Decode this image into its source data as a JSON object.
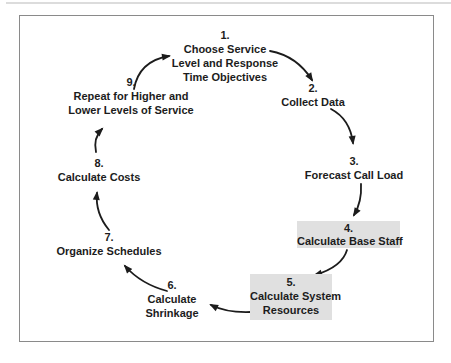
{
  "diagram": {
    "name": "call-center-planning-cycle",
    "steps": [
      {
        "number": "1.",
        "lines": [
          "Choose Service",
          "Level and Response",
          "Time Objectives"
        ],
        "highlighted": false
      },
      {
        "number": "2.",
        "lines": [
          "Collect Data"
        ],
        "highlighted": false
      },
      {
        "number": "3.",
        "lines": [
          "Forecast Call Load"
        ],
        "highlighted": false
      },
      {
        "number": "4.",
        "lines": [
          "Calculate Base Staff"
        ],
        "highlighted": true
      },
      {
        "number": "5.",
        "lines": [
          "Calculate System",
          "Resources"
        ],
        "highlighted": true
      },
      {
        "number": "6.",
        "lines": [
          "Calculate",
          "Shrinkage"
        ],
        "highlighted": false
      },
      {
        "number": "7.",
        "lines": [
          "Organize Schedules"
        ],
        "highlighted": false
      },
      {
        "number": "8.",
        "lines": [
          "Calculate Costs"
        ],
        "highlighted": false
      },
      {
        "number": "9.",
        "lines": [
          "Repeat for Higher and",
          "Lower Levels of Service"
        ],
        "highlighted": false
      }
    ],
    "flow": [
      "1>2",
      "2>3",
      "3>4",
      "4>5",
      "5>6",
      "6>7",
      "7>8",
      "8>9",
      "9>1"
    ],
    "colors": {
      "highlight_bg": "#e0e0e0",
      "text": "#1c1c1c",
      "arrow": "#1c1c1c",
      "frame_border": "#8a8a8a",
      "background": "#ffffff"
    }
  }
}
